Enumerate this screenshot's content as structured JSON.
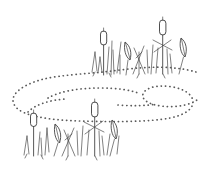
{
  "artwork": {
    "title": "Marsh cattails with winding dotted trail",
    "subject": "cattail-reed-marsh",
    "style": "pen-and-ink line drawing",
    "canvas": {
      "width": 208,
      "height": 171
    },
    "background_color": "#ffffff",
    "ink_color": "#3a3a3a",
    "dotted_color": "#5a5a5a"
  },
  "elements": {
    "upper_cluster_label": "Upper right cattail cluster",
    "lower_cluster_label": "Lower left cattail cluster",
    "trail_label": "Winding dotted S-shaped trail",
    "cattail_head_label": "Cattail seed head",
    "leaf_label": "Pointed leaf blade",
    "stem_label": "Reed stem",
    "grass_label": "Grass blade"
  },
  "counts": {
    "cattail_heads_upper": 2,
    "cattail_heads_lower": 2,
    "leaves_upper": 2,
    "leaves_lower": 2,
    "clusters": 2,
    "trails": 1
  }
}
